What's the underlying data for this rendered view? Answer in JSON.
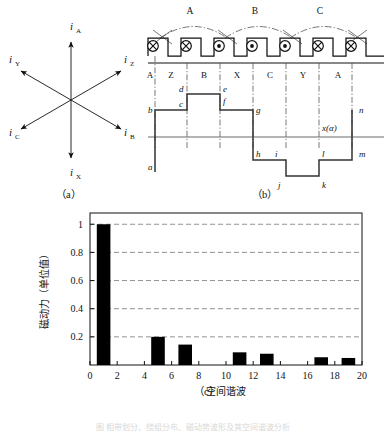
{
  "figure": {
    "width": 386,
    "height": 433,
    "bottom_caption": "图  相带划分、绕组分布、磁动势波形及其空间谐波分析"
  },
  "panel_a": {
    "label": "（a）",
    "description": "six-phase current phasor star",
    "vectors": [
      {
        "name": "i_A",
        "symbol": "i",
        "subscript": "A",
        "angle_deg": 90,
        "label_x": 75,
        "label_y": 28
      },
      {
        "name": "i_Z",
        "symbol": "i",
        "subscript": "Z",
        "angle_deg": 30,
        "label_x": 124,
        "label_y": 62
      },
      {
        "name": "i_B",
        "symbol": "i",
        "subscript": "B",
        "angle_deg": -30,
        "label_x": 124,
        "label_y": 135
      },
      {
        "name": "i_X",
        "symbol": "i",
        "subscript": "X",
        "angle_deg": -90,
        "label_x": 75,
        "label_y": 172
      },
      {
        "name": "i_C",
        "symbol": "i",
        "subscript": "C",
        "angle_deg": 210,
        "label_x": 18,
        "label_y": 135
      },
      {
        "name": "i_Y",
        "symbol": "i",
        "subscript": "Y",
        "angle_deg": 150,
        "label_x": 18,
        "label_y": 62
      }
    ]
  },
  "panel_b": {
    "label": "（b）",
    "slots": [
      {
        "index": 1,
        "marker": "cross",
        "phase": "A"
      },
      {
        "index": 2,
        "marker": "cross",
        "phase": "Z"
      },
      {
        "index": 3,
        "marker": "dot",
        "phase": "B"
      },
      {
        "index": 4,
        "marker": "dot",
        "phase": "X"
      },
      {
        "index": 5,
        "marker": "dot",
        "phase": "C"
      },
      {
        "index": 6,
        "marker": "cross",
        "phase": "Y"
      },
      {
        "index": 7,
        "marker": "cross",
        "phase": "A"
      }
    ],
    "coils": [
      {
        "name": "A",
        "label": "A"
      },
      {
        "name": "B",
        "label": "B"
      },
      {
        "name": "C",
        "label": "C"
      }
    ],
    "phase_band_labels": [
      "A",
      "Z",
      "B",
      "X",
      "C",
      "Y",
      "A"
    ],
    "mmf_axis_label": "x(α)",
    "mmf_points": [
      {
        "id": "a",
        "label": "a"
      },
      {
        "id": "b",
        "label": "b"
      },
      {
        "id": "c",
        "label": "c"
      },
      {
        "id": "d",
        "label": "d"
      },
      {
        "id": "e",
        "label": "e"
      },
      {
        "id": "f",
        "label": "f"
      },
      {
        "id": "g",
        "label": "g"
      },
      {
        "id": "h",
        "label": "h"
      },
      {
        "id": "i",
        "label": "i"
      },
      {
        "id": "j",
        "label": "j"
      },
      {
        "id": "k",
        "label": "k"
      },
      {
        "id": "l",
        "label": "l"
      },
      {
        "id": "m",
        "label": "m"
      },
      {
        "id": "n",
        "label": "n"
      }
    ]
  },
  "panel_c": {
    "label": "（c）"
  },
  "chart_data": {
    "type": "bar",
    "title": "",
    "xlabel": "空间谐波",
    "ylabel": "磁动力（单位值）",
    "categories": [
      1,
      5,
      7,
      11,
      13,
      17,
      19
    ],
    "values": [
      1.0,
      0.2,
      0.145,
      0.09,
      0.08,
      0.055,
      0.05
    ],
    "xlim": [
      0,
      20
    ],
    "ylim": [
      0,
      1.08
    ],
    "xticks": [
      0,
      2,
      4,
      6,
      8,
      10,
      12,
      14,
      16,
      18,
      20
    ],
    "xticklabels": [
      "0",
      "2",
      "4",
      "6",
      "8",
      "10",
      "12",
      "14",
      "16",
      "18",
      "20"
    ],
    "yticks": [
      0.2,
      0.4,
      0.6,
      0.8,
      1
    ],
    "yticklabels": [
      "0.2",
      "0.4",
      "0.6",
      "0.8",
      "1"
    ],
    "grid": "horizontal-dashed",
    "bar_color": "#000000",
    "bar_width": 1.0,
    "legend": null
  }
}
